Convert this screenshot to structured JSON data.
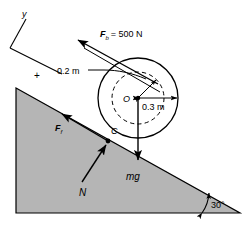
{
  "figure": {
    "type": "physics-free-body-diagram",
    "background_color": "#ffffff",
    "line_color": "#000000",
    "incline_fill": "#b5b5b5"
  },
  "axes": {
    "y_label": "y",
    "plus_label": "+"
  },
  "labels": {
    "applied_force": "F",
    "applied_force_sub": "b",
    "applied_force_value": "= 500 N",
    "inner_radius": "0.2 m",
    "outer_radius": "0.3 m",
    "center": "O",
    "contact_point": "C",
    "friction": "F",
    "friction_sub": "f",
    "normal": "N",
    "weight": "mg",
    "incline_angle": "30°"
  },
  "geometry": {
    "circle_center_x": 138,
    "circle_center_y": 98,
    "outer_radius_px": 40,
    "inner_radius_px": 26,
    "incline_angle_deg": 30
  }
}
